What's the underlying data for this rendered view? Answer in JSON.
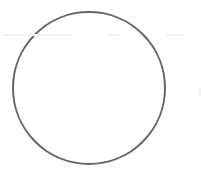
{
  "diagram": {
    "shapes": [
      {
        "type": "circle",
        "cx": 89,
        "cy": 88,
        "r": 76,
        "stroke": "#666666",
        "stroke_width": 2,
        "fill": "#ffffff"
      }
    ]
  }
}
